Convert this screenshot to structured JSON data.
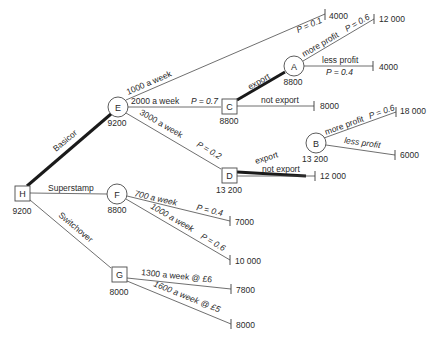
{
  "diagram": {
    "type": "decision-tree",
    "nodes": {
      "H": {
        "label": "H",
        "shape": "square",
        "value": "9200"
      },
      "E": {
        "label": "E",
        "shape": "circle",
        "value": "9200"
      },
      "F": {
        "label": "F",
        "shape": "circle",
        "value": "8800"
      },
      "G": {
        "label": "G",
        "shape": "square",
        "value": "8000"
      },
      "C": {
        "label": "C",
        "shape": "square",
        "value": "8800"
      },
      "D": {
        "label": "D",
        "shape": "square",
        "value": "13 200"
      },
      "A": {
        "label": "A",
        "shape": "circle",
        "value": "8800"
      },
      "B": {
        "label": "B",
        "shape": "circle",
        "value": "13 200"
      }
    },
    "branches": {
      "basicor": "Basicor",
      "superstamp": "Superstamp",
      "switchover": "Switchover",
      "e_1000": "1000 a week",
      "e_1000_p": "P = 0.1",
      "e_2000": "2000 a week",
      "e_2000_p": "P = 0.7",
      "e_3000": "3000 a week",
      "e_3000_p": "P = 0.2",
      "c_export": "export",
      "c_not_export": "not export",
      "a_more": "more profit",
      "a_more_p": "P = 0.6",
      "a_less": "less profit",
      "a_less_p": "P = 0.4",
      "d_export": "export",
      "d_not_export": "not export",
      "b_more": "more profit",
      "b_more_p": "P = 0.6",
      "b_less": "less profit",
      "f_700": "700 a week",
      "f_700_p": "P = 0.4",
      "f_1000": "1000 a week",
      "f_1000_p": "P = 0.6",
      "g_1300": "1300 a week @ £6",
      "g_1600": "1600 a week @ £5"
    },
    "terminals": {
      "e_1000": "4000",
      "a_more": "12 000",
      "a_less": "4000",
      "c_not_export": "8000",
      "b_more": "18 000",
      "b_less": "6000",
      "d_not_export": "12 000",
      "f_700": "7000",
      "f_1000": "10 000",
      "g_1300": "7800",
      "g_1600": "8000"
    },
    "optimal_path": [
      "H",
      "E",
      "C",
      "A",
      "D",
      "B"
    ]
  }
}
